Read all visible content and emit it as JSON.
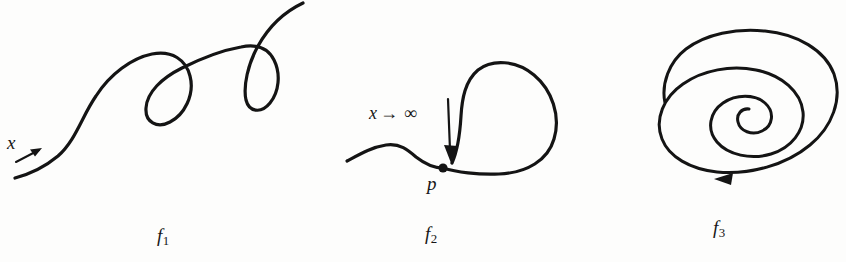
{
  "figure": {
    "kind": "scanned-textbook-figure",
    "background_color": "#fdfdfc",
    "ink_color": "#141414",
    "width": 846,
    "height": 262,
    "panels": [
      {
        "id": "f1",
        "caption_base": "f",
        "caption_sub": "1",
        "description": "Open curve with two loops sweeping up to the right",
        "annotations": [
          {
            "id": "x-direction",
            "text": "x",
            "role": "flow-direction-label"
          }
        ],
        "has_direction_arrow": true
      },
      {
        "id": "f2",
        "caption_base": "f",
        "caption_sub": "2",
        "description": "Curve approaching a limit point p with a teardrop loop",
        "annotations": [
          {
            "id": "limit-expression",
            "text_x": "x",
            "text_op": "→",
            "text_infinity": "∞",
            "role": "limit-label"
          },
          {
            "id": "limit-point",
            "text": "p",
            "role": "point-label"
          }
        ],
        "has_direction_arrow": true
      },
      {
        "id": "f3",
        "caption_base": "f",
        "caption_sub": "3",
        "description": "Inward spiral with a direction arrow on the outer turn",
        "annotations": [],
        "has_direction_arrow": true
      }
    ]
  }
}
